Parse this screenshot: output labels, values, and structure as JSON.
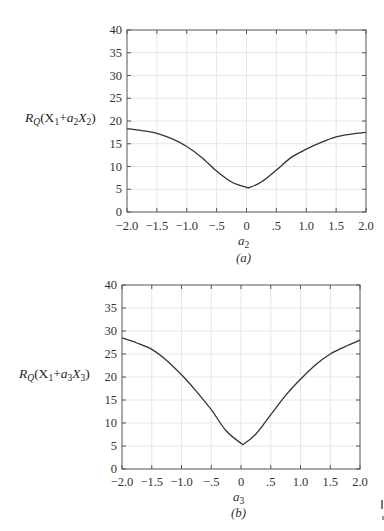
{
  "chart_data": [
    {
      "type": "line",
      "panel": "(a)",
      "title": "",
      "xlabel": "a2",
      "ylabel": "R_Q(X1 + a2 X2)",
      "caption": "(a)",
      "xlim": [
        -2.0,
        2.0
      ],
      "ylim": [
        0,
        40
      ],
      "grid": true,
      "x_ticks": [
        -2.0,
        -1.5,
        -1.0,
        -0.5,
        0,
        0.5,
        1.0,
        1.5,
        2.0
      ],
      "x_tick_labels": [
        "−2.0",
        "−1.5",
        "−1.0",
        "−.5",
        "0",
        ".5",
        "1.0",
        "1.5",
        "2.0"
      ],
      "y_ticks": [
        0,
        5,
        10,
        15,
        20,
        25,
        30,
        35,
        40
      ],
      "y_tick_labels": [
        "0",
        "5",
        "10",
        "15",
        "20",
        "25",
        "30",
        "35",
        "40"
      ],
      "series": [
        {
          "name": "R_Q(X1 + a2 X2)",
          "x": [
            -2.0,
            -1.75,
            -1.5,
            -1.25,
            -1.0,
            -0.75,
            -0.5,
            -0.25,
            0.0,
            0.05,
            0.25,
            0.5,
            0.75,
            1.0,
            1.25,
            1.5,
            1.75,
            2.0
          ],
          "y": [
            18.3,
            17.9,
            17.3,
            16.1,
            14.4,
            12.0,
            9.0,
            6.6,
            5.4,
            5.4,
            6.6,
            9.2,
            12.0,
            13.8,
            15.3,
            16.5,
            17.1,
            17.5
          ]
        }
      ],
      "min_point": {
        "x": 0.0,
        "y": 5.4
      }
    },
    {
      "type": "line",
      "panel": "(b)",
      "title": "",
      "xlabel": "a3",
      "ylabel": "R_Q(X1 + a3 X3)",
      "caption": "(b)",
      "xlim": [
        -2.0,
        2.0
      ],
      "ylim": [
        0,
        40
      ],
      "grid": true,
      "x_ticks": [
        -2.0,
        -1.5,
        -1.0,
        -0.5,
        0,
        0.5,
        1.0,
        1.5,
        2.0
      ],
      "x_tick_labels": [
        "−2.0",
        "−1.5",
        "−1.0",
        "−.5",
        "0",
        ".5",
        "1.0",
        "1.5",
        "2.0"
      ],
      "y_ticks": [
        0,
        5,
        10,
        15,
        20,
        25,
        30,
        35,
        40
      ],
      "y_tick_labels": [
        "0",
        "5",
        "10",
        "15",
        "20",
        "25",
        "30",
        "35",
        "40"
      ],
      "series": [
        {
          "name": "R_Q(X1 + a3 X3)",
          "x": [
            -2.0,
            -1.75,
            -1.5,
            -1.25,
            -1.0,
            -0.75,
            -0.5,
            -0.25,
            0.0,
            0.05,
            0.25,
            0.5,
            0.75,
            1.0,
            1.25,
            1.5,
            1.75,
            2.0
          ],
          "y": [
            28.5,
            27.4,
            26.0,
            23.6,
            20.5,
            16.9,
            12.9,
            8.3,
            5.6,
            5.5,
            7.6,
            11.8,
            16.0,
            19.5,
            22.6,
            25.0,
            26.6,
            28.0
          ]
        }
      ],
      "min_point": {
        "x": 0.0,
        "y": 5.5
      }
    }
  ],
  "panels": {
    "a": {
      "ylabel_main": "R",
      "ylabel_sub_q": "Q",
      "ylabel_rest_1": "(X",
      "ylabel_sub_1": "1",
      "ylabel_plus": "+",
      "ylabel_coef": "a",
      "ylabel_sub_coef": "2",
      "ylabel_x": "X",
      "ylabel_sub_x": "2",
      "ylabel_close": ")",
      "xlabel_var": "a",
      "xlabel_sub": "2",
      "caption": "(a)"
    },
    "b": {
      "ylabel_main": "R",
      "ylabel_sub_q": "Q",
      "ylabel_rest_1": "(X",
      "ylabel_sub_1": "1",
      "ylabel_plus": "+",
      "ylabel_coef": "a",
      "ylabel_sub_coef": "3",
      "ylabel_x": "X",
      "ylabel_sub_x": "3",
      "ylabel_close": ")",
      "xlabel_var": "a",
      "xlabel_sub": "3",
      "caption": "(b)"
    }
  },
  "colors": {
    "curve": "#333333",
    "axis": "#555555",
    "grid": "#e6e6e6",
    "tick": "#555555"
  }
}
